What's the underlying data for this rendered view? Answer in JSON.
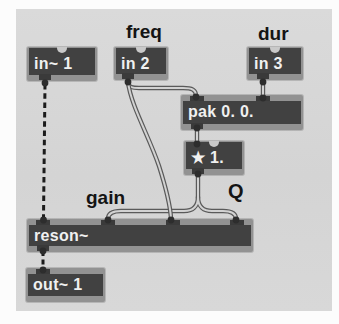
{
  "app": {
    "description": "Max/MSP patcher window region (scanned manual figure)",
    "patch_purpose": "resonant filter subpatch with signal in/out"
  },
  "colors": {
    "patcher_background": "#d6d6d6",
    "page_background": "#fcfcfc",
    "box_body": "#414141",
    "box_frame": "#929292",
    "box_text": "#f0f0f0",
    "inlet_tab": "#3a3a3a",
    "cord_outline": "#5a5a5a",
    "cord_fill": "#d2d2d2",
    "signal_cord_dashed": "#1b1b1b",
    "comment_text": "#141414"
  },
  "objects": {
    "in1": {
      "label": "in~ 1"
    },
    "in2": {
      "label": "in 2"
    },
    "in3": {
      "label": "in 3"
    },
    "pak": {
      "label": "pak 0. 0."
    },
    "mul": {
      "label": "★ 1."
    },
    "reson": {
      "label": "reson~"
    },
    "out": {
      "label": "out~ 1"
    }
  },
  "comments": {
    "freq": "freq",
    "dur": "dur",
    "gain": "gain",
    "q": "Q"
  },
  "connections": [
    "in~ 1 → reson~ (signal, dashed)",
    "in 2 → pak left inlet",
    "in 2 → reson~ frequency inlet",
    "in 3 → pak right inlet",
    "pak → * 1.",
    "* 1. → reson~ gain inlet",
    "* 1. → reson~ Q inlet",
    "reson~ → out~ 1 (signal, dashed)"
  ]
}
